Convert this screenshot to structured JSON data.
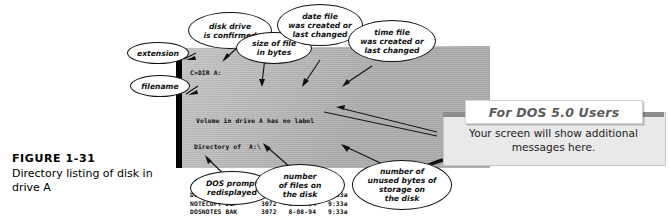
{
  "figure": {
    "number": "FIGURE 1-31",
    "caption": "Directory listing of disk in drive A"
  },
  "terminal": {
    "prompt_command": "C>DIR A:",
    "volume_line": "Volume in drive A has no label",
    "directory_line": " Directory of  A:\\",
    "columns": [
      "filename",
      "extension",
      "size",
      "date",
      "time"
    ],
    "files": [
      {
        "name": "DOSNOTES",
        "ext": "DOC",
        "size": "3072",
        "date": "8-08-94",
        "time": "9:33a"
      },
      {
        "name": "NOTECOPY",
        "ext": "DUP",
        "size": "3072",
        "date": "8-08-94",
        "time": "9:33a"
      },
      {
        "name": "DOSNOTES",
        "ext": "BAK",
        "size": "3072",
        "date": "8-08-94",
        "time": "9:33a"
      },
      {
        "name": "DOSFILE",
        "ext": "DOC",
        "size": "3072",
        "date": "8-08-94",
        "time": "9:33a"
      },
      {
        "name": "DOSFILE",
        "ext": "BAK",
        "size": "3072",
        "date": "8-08-94",
        "time": "9:33a"
      }
    ],
    "summary": "    5 File(s)    714752 bytes free",
    "final_prompt": "C>"
  },
  "callouts": {
    "extension": "extension",
    "filename": "filename",
    "disk_drive": "disk drive\nis confirmed",
    "size_of_file": "size of file\nin bytes",
    "date_file": "date file\nwas created or\nlast changed",
    "time_file": "time file\nwas created or\nlast changed",
    "dos_prompt": "DOS prompt\nredisplayed",
    "number_of_files": "number\nof files on\nthe disk",
    "unused_bytes": "number of\nunused bytes of\nstorage on\nthe disk"
  },
  "dos_note": {
    "title": "For DOS 5.0 Users",
    "body": "Your screen will show additional messages here."
  },
  "colors": {
    "screen_gray": "#b6b6b6",
    "bezel_black": "#000000",
    "note_tab_text": "#5c5c5c",
    "note_panel": "#e9e9e9",
    "note_rule": "#8c8c8c"
  }
}
